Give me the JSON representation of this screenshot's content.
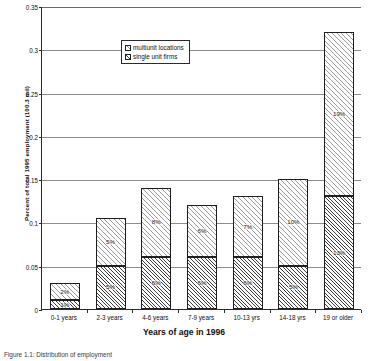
{
  "chart_data": {
    "type": "bar",
    "stacked": true,
    "title": "",
    "xlabel": "Years of age in 1996",
    "ylabel": "Percent of total 1995 employment (100.3 mil)",
    "categories": [
      "0-1 years",
      "2-3 years",
      "4-6 years",
      "7-9 years",
      "10-13 yrs",
      "14-18 yrs",
      "19 or older"
    ],
    "ylim": [
      0,
      0.35
    ],
    "ytick_labels": [
      "0",
      "0.05",
      "0.1",
      "0.15",
      "0.2",
      "0.25",
      "0.3",
      "0.35"
    ],
    "ytick_values": [
      0,
      0.05,
      0.1,
      0.15,
      0.2,
      0.25,
      0.3,
      0.35
    ],
    "grid": true,
    "legend_position": "upper-left-inside",
    "series": [
      {
        "name": "single unit firms",
        "values": [
          0.01,
          0.05,
          0.06,
          0.06,
          0.06,
          0.05,
          0.13
        ],
        "data_labels": [
          "1%",
          "5%",
          "6%",
          "6%",
          "6%",
          "5%",
          "13%"
        ]
      },
      {
        "name": "multiunit locations",
        "values": [
          0.02,
          0.055,
          0.08,
          0.06,
          0.07,
          0.1,
          0.19
        ],
        "data_labels": [
          "2%",
          "5%",
          "8%",
          "6%",
          "7%",
          "10%",
          "19%"
        ]
      }
    ],
    "totals": [
      0.03,
      0.105,
      0.14,
      0.12,
      0.13,
      0.15,
      0.32
    ]
  },
  "legend": {
    "items": [
      {
        "label": "multiunit locations"
      },
      {
        "label": "single unit firms"
      }
    ]
  },
  "caption": "Figure 1.1: Distribution of employment"
}
